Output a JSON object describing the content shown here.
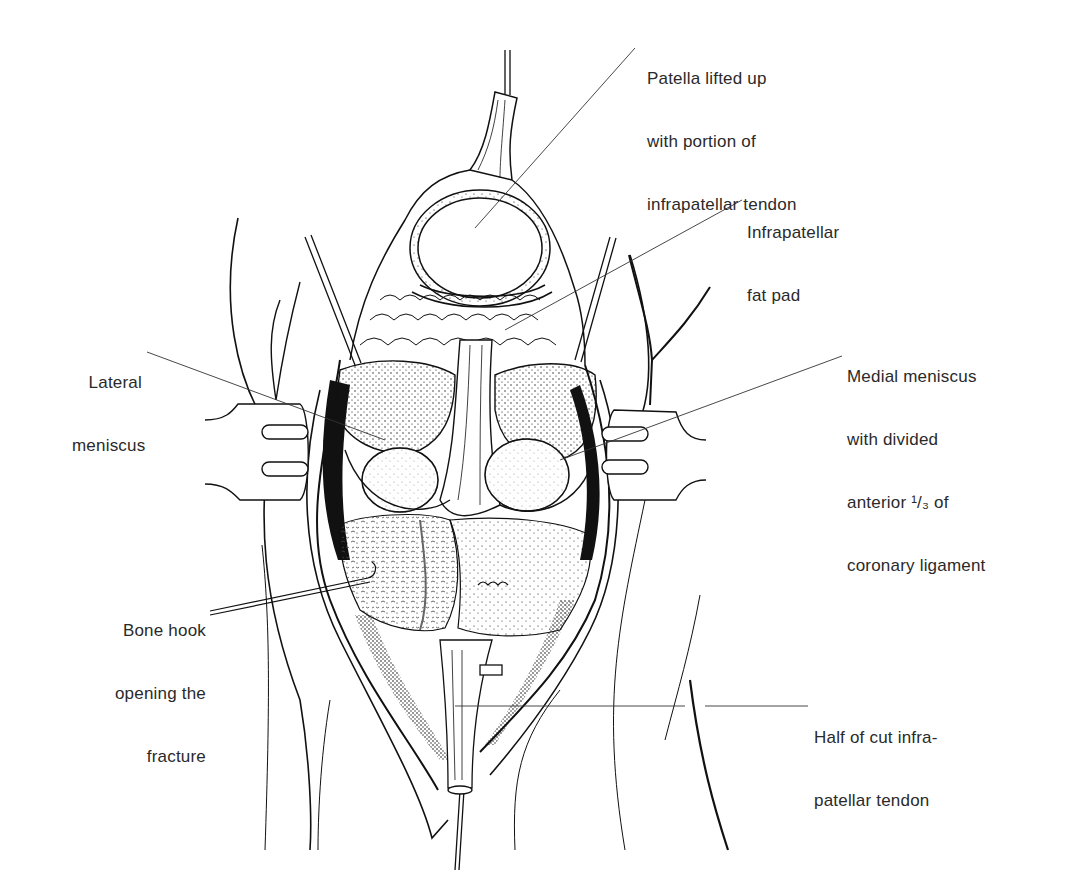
{
  "figure": {
    "colors": {
      "ink": "#111111",
      "background": "#ffffff",
      "label_text": "#2a2a2a"
    }
  },
  "labels": [
    {
      "id": "patella",
      "lines": [
        "Patella lifted up",
        "with portion of",
        "infrapatellar tendon"
      ],
      "align": "left",
      "leader": {
        "from": [
          635,
          48
        ],
        "to": [
          475,
          228
        ]
      }
    },
    {
      "id": "fat-pad",
      "lines": [
        "Infrapatellar",
        "fat pad"
      ],
      "align": "left",
      "leader": {
        "from": [
          742,
          200
        ],
        "to": [
          505,
          330
        ]
      }
    },
    {
      "id": "medial-meniscus",
      "lines": [
        "Medial meniscus",
        "with divided",
        "anterior ¹/₃ of",
        "coronary ligament"
      ],
      "align": "left",
      "leader": {
        "from": [
          842,
          356
        ],
        "to": [
          560,
          460
        ]
      }
    },
    {
      "id": "lateral-meniscus",
      "lines": [
        "Lateral",
        "meniscus"
      ],
      "align": "right",
      "leader": {
        "from": [
          147,
          352
        ],
        "to": [
          385,
          440
        ]
      }
    },
    {
      "id": "bone-hook",
      "lines": [
        "Bone hook",
        "opening the",
        "fracture"
      ],
      "align": "right",
      "leader": {
        "from": [
          210,
          610
        ],
        "to": [
          370,
          570
        ]
      }
    },
    {
      "id": "cut-tendon",
      "lines": [
        "Half of cut infra-",
        "patellar tendon"
      ],
      "align": "left",
      "leader": {
        "from": [
          810,
          706
        ],
        "to": [
          455,
          706
        ]
      }
    }
  ]
}
